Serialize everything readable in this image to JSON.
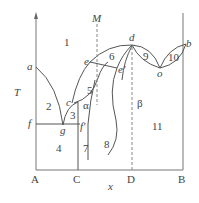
{
  "diagram": {
    "type": "binary phase diagram",
    "axes": {
      "y_label": "T",
      "x_label": "x"
    },
    "compositions": [
      "A",
      "C",
      "D",
      "B"
    ],
    "vertical_marker": "M",
    "points": [
      "a",
      "b",
      "c",
      "d",
      "e",
      "e'",
      "f",
      "f'",
      "g",
      "o"
    ],
    "regions": [
      "1",
      "2",
      "3",
      "4",
      "5",
      "6",
      "7",
      "8",
      "9",
      "10",
      "11"
    ],
    "phases": [
      "α",
      "β"
    ]
  },
  "labels": {
    "T": "T",
    "x": "x",
    "M": "M",
    "A": "A",
    "C": "C",
    "D": "D",
    "B": "B",
    "a": "a",
    "b": "b",
    "c": "c",
    "d": "d",
    "e": "e",
    "e_prime": "e'",
    "f": "f",
    "f_prime": "f'",
    "g": "g",
    "o": "o",
    "r1": "1",
    "r2": "2",
    "r3": "3",
    "r4": "4",
    "r5": "5",
    "r6": "6",
    "r7": "7",
    "r8": "8",
    "r9": "9",
    "r10": "10",
    "r11": "11",
    "alpha": "α",
    "beta": "β"
  }
}
